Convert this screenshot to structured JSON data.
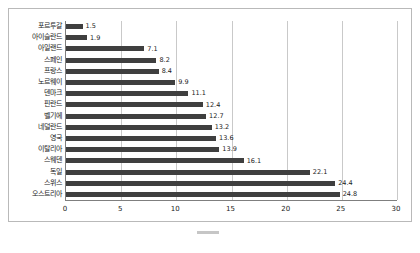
{
  "chart_data": {
    "type": "bar",
    "orientation": "horizontal",
    "title": "",
    "xlabel": "",
    "ylabel": "",
    "xlim": [
      0,
      30
    ],
    "xticks": [
      0,
      5,
      10,
      15,
      20,
      25,
      30
    ],
    "grid": true,
    "legend": false,
    "bar_color": "#3f3f3f",
    "categories": [
      "포르투갈",
      "아이슬란드",
      "아일랜드",
      "스페인",
      "프랑스",
      "노르웨이",
      "덴마크",
      "핀란드",
      "벨기에",
      "네덜란드",
      "영국",
      "이탈리아",
      "스웨덴",
      "독일",
      "스위스",
      "오스트리아"
    ],
    "values": [
      1.5,
      1.9,
      7.1,
      8.2,
      8.4,
      9.9,
      11.1,
      12.4,
      12.7,
      13.2,
      13.6,
      13.9,
      16.1,
      22.1,
      24.4,
      24.8
    ],
    "value_labels": [
      "1.5",
      "1.9",
      "7.1",
      "8.2",
      "8.4",
      "9.9",
      "11.1",
      "12.4",
      "12.7",
      "13.2",
      "13.6",
      "13.9",
      "16.1",
      "22.1",
      "24.4",
      "24.8"
    ]
  },
  "caption": {
    "text": ""
  }
}
